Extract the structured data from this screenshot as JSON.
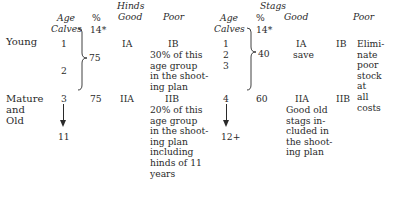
{
  "header": {
    "hinds_title": "Hinds",
    "stags_title": "Stags",
    "age": "Age",
    "calves": "Calves",
    "percent": "%",
    "good": "Good",
    "poor": "Poor"
  },
  "rows": {
    "young": {
      "label": "Young",
      "hinds": {
        "ages": [
          "1",
          "2"
        ],
        "calves_pct": "14*",
        "pct": "75",
        "good": "IA",
        "poor_code": "IB",
        "poor_text": [
          "30% of this",
          "age group",
          "in the shoot-",
          "ing plan"
        ]
      },
      "stags": {
        "ages": [
          "1",
          "2",
          "3"
        ],
        "calves_pct": "14*",
        "pct": "40",
        "good_code": "IA",
        "good_text": "save",
        "poor_code": "IB",
        "poor_text": [
          "Elimi-",
          "nate",
          "poor",
          "stock",
          "at",
          "all",
          "costs"
        ]
      }
    },
    "mature": {
      "label": [
        "Mature",
        "and",
        "Old"
      ],
      "hinds": {
        "age_start": "3",
        "age_end": "11",
        "pct": "75",
        "good": "IIA",
        "poor_code": "IIB",
        "poor_text": [
          "20% of this",
          "age group",
          "in the shoot-",
          "ing plan",
          "including",
          "hinds of 11",
          "years"
        ]
      },
      "stags": {
        "age_start": "4",
        "age_end": "12+",
        "pct": "60",
        "good_code": "IIA",
        "good_text": [
          "Good old",
          "stags in-",
          "cluded in",
          "the shoot-",
          "ing plan"
        ],
        "poor_code": "IIB"
      }
    }
  }
}
